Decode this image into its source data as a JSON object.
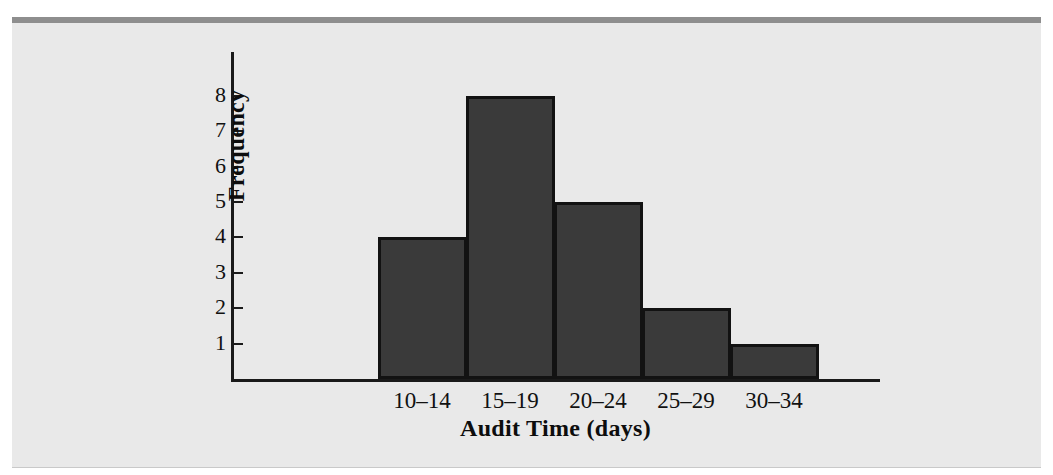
{
  "figure": {
    "background_color": "#e9e9e9",
    "rule_color": "#8e8e8e",
    "bar_fill_color": "#3a3a3a",
    "bar_edge_color": "#121212",
    "axis_color": "#1a1a1a"
  },
  "chart_data": {
    "type": "bar",
    "title": "",
    "subtitle": "",
    "xlabel": "Audit Time (days)",
    "ylabel": "Frequency",
    "categories": [
      "10–14",
      "15–19",
      "20–24",
      "25–29",
      "30–34"
    ],
    "values": [
      4,
      8,
      5,
      2,
      1
    ],
    "series": [
      {
        "name": "Frequency",
        "values": [
          4,
          8,
          5,
          2,
          1
        ]
      }
    ],
    "ylim": [
      0,
      9
    ],
    "xlim": [
      0,
      5
    ],
    "y_ticks": [
      1,
      2,
      3,
      4,
      5,
      6,
      7,
      8
    ],
    "y_tick_labels": [
      "1",
      "2",
      "3",
      "4",
      "5",
      "6",
      "7",
      "8"
    ],
    "grid": false,
    "legend": false,
    "legend_position": "none",
    "annotations": [],
    "bar_gap": 0,
    "note": "Histogram of audit times, adjacent bars with no gaps"
  }
}
